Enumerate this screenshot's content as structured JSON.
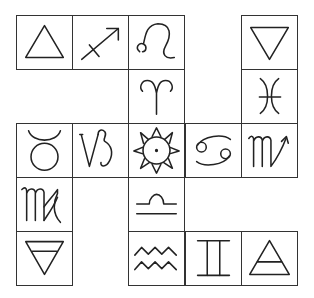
{
  "grid": {
    "columns": 5,
    "rows": 5
  },
  "cells": [
    {
      "row": 0,
      "col": 0,
      "symbol": "fire",
      "label": "Fire"
    },
    {
      "row": 0,
      "col": 1,
      "symbol": "sagittarius",
      "label": "Sagittarius"
    },
    {
      "row": 0,
      "col": 2,
      "symbol": "leo",
      "label": "Leo"
    },
    {
      "row": 0,
      "col": 4,
      "symbol": "water",
      "label": "Water"
    },
    {
      "row": 1,
      "col": 2,
      "symbol": "aries",
      "label": "Aries"
    },
    {
      "row": 1,
      "col": 4,
      "symbol": "pisces",
      "label": "Pisces"
    },
    {
      "row": 2,
      "col": 0,
      "symbol": "taurus",
      "label": "Taurus"
    },
    {
      "row": 2,
      "col": 1,
      "symbol": "capricorn",
      "label": "Capricorn"
    },
    {
      "row": 2,
      "col": 2,
      "symbol": "sun",
      "label": "Sun"
    },
    {
      "row": 2,
      "col": 3,
      "symbol": "cancer",
      "label": "Cancer"
    },
    {
      "row": 2,
      "col": 4,
      "symbol": "scorpio",
      "label": "Scorpio"
    },
    {
      "row": 3,
      "col": 0,
      "symbol": "virgo",
      "label": "Virgo"
    },
    {
      "row": 3,
      "col": 2,
      "symbol": "libra",
      "label": "Libra"
    },
    {
      "row": 4,
      "col": 0,
      "symbol": "earth",
      "label": "Earth"
    },
    {
      "row": 4,
      "col": 2,
      "symbol": "aquarius",
      "label": "Aquarius"
    },
    {
      "row": 4,
      "col": 3,
      "symbol": "gemini",
      "label": "Gemini"
    },
    {
      "row": 4,
      "col": 4,
      "symbol": "air",
      "label": "Air"
    }
  ]
}
